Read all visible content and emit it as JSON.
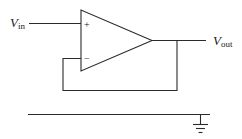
{
  "diagram": {
    "type": "op-amp voltage follower (unity-gain buffer)",
    "input_label": {
      "main": "V",
      "sub": "in"
    },
    "output_label": {
      "main": "V",
      "sub": "out"
    },
    "opamp": {
      "noninverting_sign": "+",
      "inverting_sign": "−"
    },
    "connections": [
      "V_in to non-inverting input (+)",
      "Output to V_out",
      "Output fed back to inverting input (−)",
      "Ground rail with ground symbol"
    ],
    "colors": {
      "line": "#2a2a2a",
      "background": "#ffffff"
    }
  }
}
